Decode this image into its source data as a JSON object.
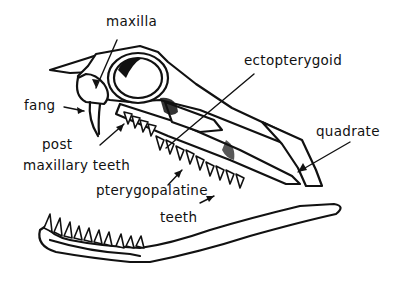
{
  "diagram": {
    "ink_color": "#111111",
    "background": "#ffffff",
    "labels": [
      {
        "id": "maxilla",
        "text": "maxilla"
      },
      {
        "id": "ectopterygoid",
        "text": "ectopterygoid"
      },
      {
        "id": "fang",
        "text": "fang"
      },
      {
        "id": "post",
        "text": "post"
      },
      {
        "id": "maxillary_teeth",
        "text": "maxillary teeth"
      },
      {
        "id": "quadrate",
        "text": "quadrate"
      },
      {
        "id": "pterygopalatine",
        "text": "pterygopalatine"
      },
      {
        "id": "teeth",
        "text": "teeth"
      }
    ]
  }
}
